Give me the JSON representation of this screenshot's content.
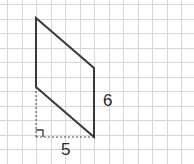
{
  "canvas": {
    "width": 194,
    "height": 164,
    "background_color": "#ffffff"
  },
  "grid": {
    "visible": true,
    "cell_size": 14.5,
    "offset_x": 7,
    "offset_y": 4,
    "line_color": "#d4d4d8",
    "line_width": 1
  },
  "figure": {
    "kind": "parallelogram",
    "stroke_color": "#3a3a3a",
    "stroke_width": 2,
    "fill": "none",
    "vertices": [
      {
        "name": "top-left",
        "x": 36,
        "y": 18
      },
      {
        "name": "top-right",
        "x": 94,
        "y": 68
      },
      {
        "name": "bottom-right",
        "x": 94,
        "y": 137
      },
      {
        "name": "bottom-left",
        "x": 36,
        "y": 87
      }
    ],
    "helper_lines": [
      {
        "name": "height-dashed-vertical",
        "x1": 36,
        "y1": 87,
        "x2": 36,
        "y2": 137
      },
      {
        "name": "base-dashed-horizontal",
        "x1": 36,
        "y1": 137,
        "x2": 94,
        "y2": 137
      }
    ],
    "right_angle_marker": {
      "x": 36,
      "y": 137,
      "size": 7
    },
    "dash_color": "#4a4a4a",
    "dash_pattern": "2,2"
  },
  "labels": {
    "side_right": "6",
    "base": "5"
  }
}
